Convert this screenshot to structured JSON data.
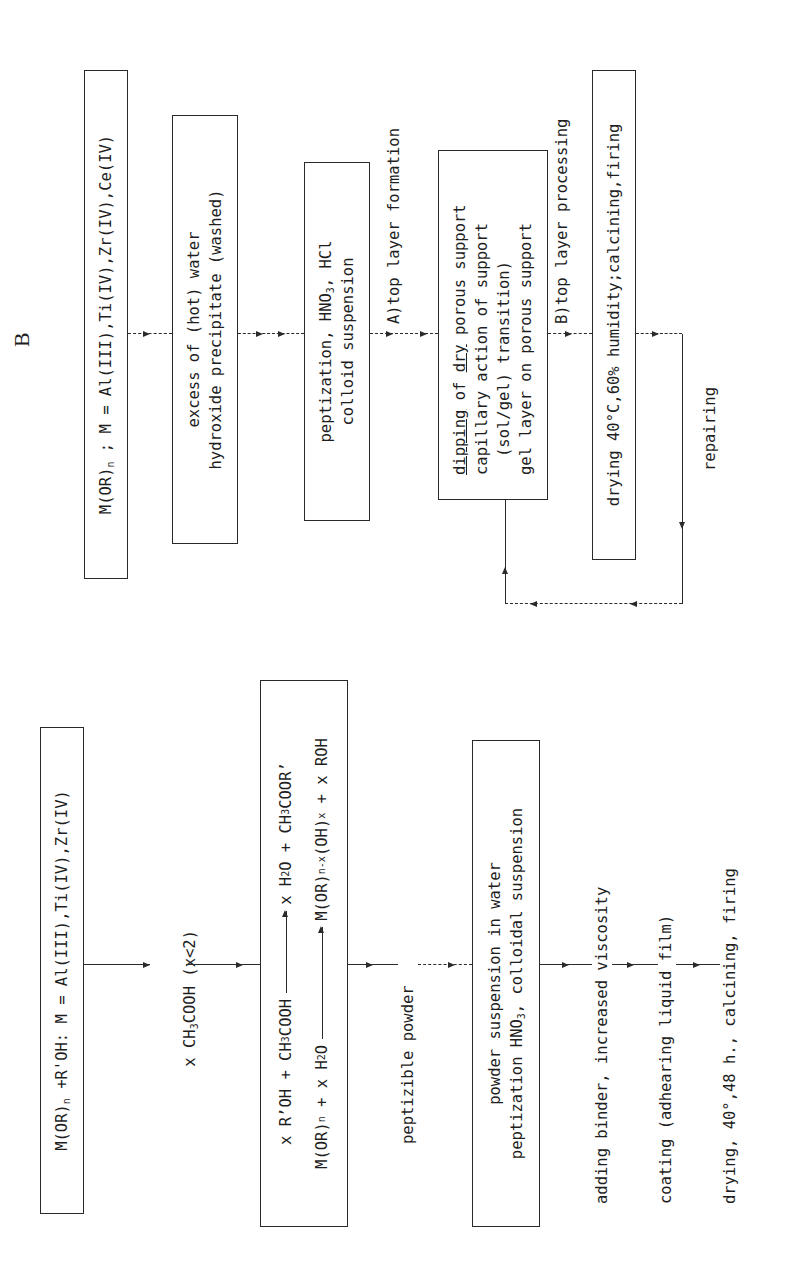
{
  "figure": {
    "section_label": "B",
    "section_b": {
      "steps": [
        {
          "id": "b1",
          "type": "box",
          "lines": [
            "M(OR)_n ; M = Al(III),Ti(IV),Zr(IV),Ce(IV)"
          ],
          "line_parts": {
            "pre": "M(OR)",
            "sub": "n",
            "post": " ; M = Al(III),Ti(IV),Zr(IV),Ce(IV)"
          }
        },
        {
          "id": "b2",
          "type": "box",
          "lines": [
            "excess of (hot) water",
            "hydroxide precipitate (washed)"
          ]
        },
        {
          "id": "b3",
          "type": "box",
          "lines": [
            "peptization, HNO3, HCl",
            "colloid suspension"
          ],
          "line_parts": {
            "pre": "peptization, HNO",
            "sub": "3",
            "post": ", HCl"
          }
        },
        {
          "id": "b_label_a",
          "type": "label",
          "text": "A)top layer formation"
        },
        {
          "id": "b4",
          "type": "box",
          "lines": [
            "dipping of dry porous support",
            "capillary action of support",
            "(sol/gel) transition)",
            "gel layer on porous support"
          ],
          "line_parts": {
            "underline1": "dipping",
            "mid": " of ",
            "underline2": "dry",
            "post": " porous support"
          }
        },
        {
          "id": "b_label_b",
          "type": "label",
          "text": "B)top layer processing"
        },
        {
          "id": "b5",
          "type": "box",
          "lines": [
            "drying 40°C,60% humidity;calcining,firing"
          ]
        },
        {
          "id": "b_repair",
          "type": "label",
          "text": "repairing"
        }
      ]
    },
    "section_a": {
      "steps": [
        {
          "id": "a1",
          "type": "box",
          "lines": [
            "M(OR)n +R'OH: M = Al(III),Ti(IV),Zr(IV)"
          ],
          "line_parts": {
            "pre": "M(OR)",
            "sub": "n",
            "post": " +R'OH: M = Al(III),Ti(IV),Zr(IV)"
          }
        },
        {
          "id": "a_reagent",
          "type": "label",
          "text": "x CH3COOH (x<2)",
          "line_parts": {
            "pre": "x CH",
            "sub": "3",
            "post": "COOH (x<2)"
          }
        },
        {
          "id": "a2",
          "type": "box",
          "reactions": [
            {
              "lhs": "x R'OH + CH3COOH",
              "rhs": "x H2O + CH3COOR'"
            },
            {
              "lhs": "M(OR)n + x H2O",
              "rhs": "M(OR)n-x(OH)x + x ROH"
            }
          ],
          "parts": {
            "r1_lhs_a": "x R’OH + CH",
            "r1_lhs_sub": "3",
            "r1_lhs_b": "COOH",
            "r1_rhs_a": "x H",
            "r1_rhs_sub1": "2",
            "r1_rhs_b": "O + CH",
            "r1_rhs_sub2": "3",
            "r1_rhs_c": "COOR’",
            "r2_lhs_a": "M(OR)",
            "r2_lhs_sub": "n",
            "r2_lhs_b": " + x H",
            "r2_lhs_sub2": "2",
            "r2_lhs_c": "O",
            "r2_rhs_a": "M(OR)",
            "r2_rhs_sub1": "n-x",
            "r2_rhs_b": "(OH)",
            "r2_rhs_sub2": "x",
            "r2_rhs_c": " + x ROH"
          }
        },
        {
          "id": "a_powder",
          "type": "label",
          "text": "peptizible powder"
        },
        {
          "id": "a3",
          "type": "box",
          "lines": [
            "powder suspension in water",
            "peptization HNO3, colloidal suspension"
          ],
          "line_parts": {
            "pre": "peptization HNO",
            "sub": "3",
            "post": ", colloidal suspension"
          }
        },
        {
          "id": "a_binder",
          "type": "label",
          "text": "adding binder, increased viscosity"
        },
        {
          "id": "a_coating",
          "type": "label",
          "text": "coating (adhearing liquid film)"
        },
        {
          "id": "a_drying",
          "type": "label",
          "text": "drying, 40°,48 h., calcining, firing"
        }
      ]
    }
  }
}
